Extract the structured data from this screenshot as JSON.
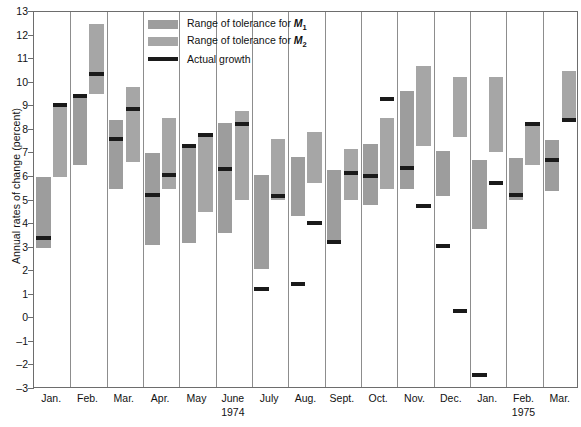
{
  "axis": {
    "ylabel": "Annual rates of change (percent)",
    "yticks": [
      13,
      12,
      11,
      10,
      9,
      8,
      7,
      6,
      5,
      4,
      3,
      2,
      1,
      0,
      -1,
      -2,
      -3
    ],
    "ymin": -3,
    "ymax": 13
  },
  "legend": {
    "items": [
      {
        "label_prefix": "Range of tolerance for ",
        "symbol": "M",
        "sub": "1",
        "key": "m1",
        "color": "#9d9d9d"
      },
      {
        "label_prefix": "Range of tolerance for ",
        "symbol": "M",
        "sub": "2",
        "key": "m2",
        "color": "#a6a6a6"
      },
      {
        "label_prefix": "Actual growth",
        "symbol": "",
        "sub": "",
        "key": "actual",
        "color": "#1a1a1a"
      }
    ]
  },
  "year_labels": [
    {
      "text": "1974",
      "month_index": 5
    },
    {
      "text": "1975",
      "month_index": 13
    }
  ],
  "chart_data": {
    "type": "bar",
    "title": "",
    "xlabel": "",
    "ylabel": "Annual rates of change (percent)",
    "ylim": [
      -3,
      13
    ],
    "grid": false,
    "legend_position": "top-center",
    "categories": [
      "Jan.",
      "Feb.",
      "Mar.",
      "Apr.",
      "May",
      "June",
      "July",
      "Aug.",
      "Sept.",
      "Oct.",
      "Nov.",
      "Dec.",
      "Jan.",
      "Feb.",
      "Mar."
    ],
    "years": [
      "1974",
      "1974",
      "1974",
      "1974",
      "1974",
      "1974",
      "1974",
      "1974",
      "1974",
      "1974",
      "1974",
      "1974",
      "1975",
      "1975",
      "1975"
    ],
    "series": [
      {
        "name": "Range of tolerance for M1",
        "type": "range",
        "low": [
          3.0,
          6.5,
          5.5,
          3.1,
          3.2,
          3.6,
          2.1,
          4.35,
          3.25,
          4.8,
          5.5,
          5.2,
          3.8,
          5.0,
          5.4
        ],
        "high": [
          6.0,
          9.5,
          8.4,
          7.0,
          7.35,
          8.3,
          6.1,
          6.85,
          6.3,
          7.4,
          9.65,
          7.1,
          6.7,
          6.8,
          7.55
        ]
      },
      {
        "name": "Range of tolerance for M2",
        "type": "range",
        "low": [
          6.0,
          9.5,
          6.65,
          5.5,
          4.5,
          5.0,
          5.0,
          5.75,
          5.0,
          5.5,
          7.3,
          7.7,
          7.05,
          6.5,
          8.35
        ],
        "high": [
          9.1,
          12.5,
          9.8,
          8.5,
          7.85,
          8.8,
          7.6,
          7.9,
          7.2,
          8.5,
          10.7,
          10.25,
          10.25,
          8.3,
          10.5
        ]
      },
      {
        "name": "Actual growth (M1)",
        "type": "marker",
        "values": [
          3.4,
          9.45,
          7.6,
          5.25,
          7.3,
          6.35,
          1.25,
          1.45,
          3.25,
          6.05,
          6.4,
          3.05,
          -2.4,
          5.25,
          6.7
        ]
      },
      {
        "name": "Actual growth (M2)",
        "type": "marker",
        "values": [
          9.05,
          10.35,
          8.9,
          6.1,
          7.8,
          8.25,
          5.2,
          4.05,
          6.15,
          9.3,
          4.75,
          0.3,
          5.75,
          8.25,
          8.4
        ]
      }
    ]
  }
}
